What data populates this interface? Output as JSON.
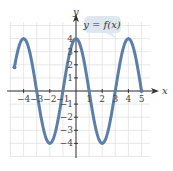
{
  "chart_data": {
    "type": "line",
    "title": "",
    "annotation": "y = f(x)",
    "xlabel": "x",
    "ylabel": "y",
    "xlim": [
      -4.7,
      5.5
    ],
    "ylim": [
      -5,
      5
    ],
    "grid": true,
    "x_ticks": [
      "-4",
      "-3",
      "-2",
      "-1",
      "1",
      "2",
      "3",
      "4",
      "5"
    ],
    "y_ticks": [
      "4",
      "3",
      "2",
      "1",
      "-1",
      "-2",
      "-3",
      "-4"
    ],
    "series": [
      {
        "name": "f(x)",
        "color": "#5b7fa8",
        "function": "4cos(pi*x/2)",
        "x": [
          -5,
          -4,
          -3,
          -2,
          -1,
          0,
          1,
          2,
          3,
          4,
          5
        ],
        "y": [
          0,
          4,
          0,
          -4,
          0,
          4,
          0,
          -4,
          0,
          4,
          0
        ]
      }
    ]
  },
  "labels": {
    "annotation": "y = f(x)",
    "x_axis": "x",
    "y_axis": "y"
  }
}
